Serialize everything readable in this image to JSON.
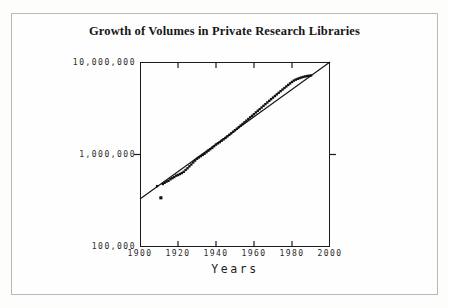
{
  "figure": {
    "background_color": "#fefefe",
    "frame_color": "#b9b9b9",
    "axis_color": "#1a1a1a"
  },
  "chart_data": {
    "type": "scatter",
    "title": "Growth of Volumes in Private Research Libraries",
    "xlabel": "Years",
    "ylabel": "",
    "xlim": [
      1900,
      2000
    ],
    "ylim": [
      100000,
      10000000
    ],
    "yscale": "log",
    "xscale": "linear",
    "grid": false,
    "legend": null,
    "xticks": [
      1900,
      1920,
      1940,
      1960,
      1980,
      2000
    ],
    "xtick_labels": [
      "1900",
      "1920",
      "1940",
      "1960",
      "1980",
      "2000"
    ],
    "yticks": [
      100000,
      1000000,
      10000000
    ],
    "ytick_labels": [
      "100,000",
      "1,000,000",
      "10,000,000"
    ],
    "marker": "square",
    "marker_color": "#111111",
    "marker_size": 2.4,
    "trendline": {
      "label": "fitted exponential growth line",
      "color": "#111111",
      "width": 1.1,
      "x_start": 1900,
      "y_start": 330000,
      "x_end": 2000,
      "y_end": 10000000
    },
    "series": [
      {
        "name": "Volumes in private research libraries",
        "x": [
          1909,
          1911,
          1912,
          1913,
          1914,
          1915,
          1916,
          1917,
          1918,
          1919,
          1920,
          1921,
          1922,
          1923,
          1924,
          1925,
          1926,
          1927,
          1928,
          1929,
          1930,
          1931,
          1932,
          1933,
          1934,
          1935,
          1936,
          1937,
          1938,
          1939,
          1940,
          1941,
          1942,
          1943,
          1944,
          1945,
          1946,
          1947,
          1948,
          1949,
          1950,
          1951,
          1952,
          1953,
          1954,
          1955,
          1956,
          1957,
          1958,
          1959,
          1960,
          1961,
          1962,
          1963,
          1964,
          1965,
          1966,
          1967,
          1968,
          1969,
          1970,
          1971,
          1972,
          1973,
          1974,
          1975,
          1976,
          1977,
          1978,
          1979,
          1980,
          1981,
          1982,
          1983,
          1984,
          1985,
          1986,
          1987,
          1988,
          1989,
          1990
        ],
        "y": [
          455000,
          340000,
          480000,
          495000,
          510000,
          520000,
          540000,
          555000,
          570000,
          590000,
          600000,
          615000,
          630000,
          650000,
          680000,
          710000,
          745000,
          780000,
          820000,
          860000,
          900000,
          930000,
          960000,
          990000,
          1020000,
          1060000,
          1100000,
          1140000,
          1180000,
          1230000,
          1280000,
          1320000,
          1360000,
          1410000,
          1460000,
          1510000,
          1570000,
          1630000,
          1690000,
          1760000,
          1830000,
          1900000,
          1980000,
          2060000,
          2140000,
          2230000,
          2320000,
          2420000,
          2520000,
          2620000,
          2730000,
          2850000,
          2970000,
          3090000,
          3220000,
          3360000,
          3500000,
          3650000,
          3800000,
          3960000,
          4120000,
          4290000,
          4470000,
          4650000,
          4840000,
          5030000,
          5230000,
          5440000,
          5650000,
          5870000,
          6090000,
          6300000,
          6450000,
          6580000,
          6700000,
          6810000,
          6900000,
          6980000,
          7050000,
          7100000,
          7150000
        ]
      }
    ],
    "annotations": [
      {
        "name": "low-outlier-point",
        "x": 1911,
        "y": 340000,
        "note": "single point falling noticeably below the trend line"
      }
    ]
  }
}
